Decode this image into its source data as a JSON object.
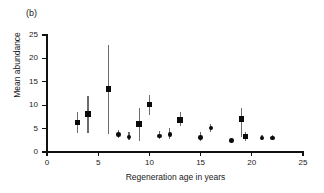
{
  "figure": {
    "panel_label": "(b)"
  },
  "chart_data": {
    "type": "scatter",
    "title": "",
    "subtitle": "",
    "xlabel": "Regeneration age in years",
    "ylabel": "Mean abundance",
    "xlim": [
      0,
      25
    ],
    "ylim": [
      0,
      25
    ],
    "xticks": [
      0,
      5,
      10,
      15,
      20,
      25
    ],
    "yticks": [
      0,
      5,
      10,
      15,
      20,
      25
    ],
    "xticklabels": [
      "0",
      "5",
      "10",
      "15",
      "20",
      "25"
    ],
    "yticklabels": [
      "0",
      "5",
      "10",
      "15",
      "20",
      "25"
    ],
    "grid": false,
    "legend": null,
    "error_bars": "vertical",
    "marker_color": "#0b0b0b",
    "errorbar_color": "#6b6b6b",
    "axis_color": "#111111",
    "points": [
      {
        "x": 3,
        "y": 6.3,
        "ylow": 4.1,
        "yhigh": 8.5,
        "marker": "square"
      },
      {
        "x": 4,
        "y": 8.1,
        "ylow": 4.1,
        "yhigh": 12.0,
        "marker": "square"
      },
      {
        "x": 6,
        "y": 13.5,
        "ylow": 3.9,
        "yhigh": 22.8,
        "marker": "square"
      },
      {
        "x": 7,
        "y": 3.8,
        "ylow": 3.0,
        "yhigh": 4.6,
        "marker": "circle"
      },
      {
        "x": 8,
        "y": 3.2,
        "ylow": 2.5,
        "yhigh": 4.3,
        "marker": "circle"
      },
      {
        "x": 9,
        "y": 6.0,
        "ylow": 2.4,
        "yhigh": 9.4,
        "marker": "square"
      },
      {
        "x": 10,
        "y": 10.2,
        "ylow": 8.0,
        "yhigh": 12.1,
        "marker": "square"
      },
      {
        "x": 11,
        "y": 3.4,
        "ylow": 2.7,
        "yhigh": 4.4,
        "marker": "circle"
      },
      {
        "x": 12,
        "y": 3.8,
        "ylow": 2.8,
        "yhigh": 5.2,
        "marker": "circle"
      },
      {
        "x": 13,
        "y": 6.8,
        "ylow": 5.6,
        "yhigh": 8.5,
        "marker": "square"
      },
      {
        "x": 15,
        "y": 3.1,
        "ylow": 2.3,
        "yhigh": 4.3,
        "marker": "circle"
      },
      {
        "x": 16,
        "y": 5.1,
        "ylow": 4.2,
        "yhigh": 6.0,
        "marker": "circle"
      },
      {
        "x": 18,
        "y": 2.5,
        "ylow": 2.3,
        "yhigh": 2.7,
        "marker": "circle"
      },
      {
        "x": 19,
        "y": 7.0,
        "ylow": 3.2,
        "yhigh": 9.4,
        "marker": "square"
      },
      {
        "x": 19.4,
        "y": 3.3,
        "ylow": 2.3,
        "yhigh": 4.3,
        "marker": "square"
      },
      {
        "x": 21,
        "y": 3.0,
        "ylow": 2.5,
        "yhigh": 3.6,
        "marker": "circle"
      },
      {
        "x": 22,
        "y": 3.0,
        "ylow": 2.5,
        "yhigh": 3.6,
        "marker": "circle"
      }
    ]
  }
}
